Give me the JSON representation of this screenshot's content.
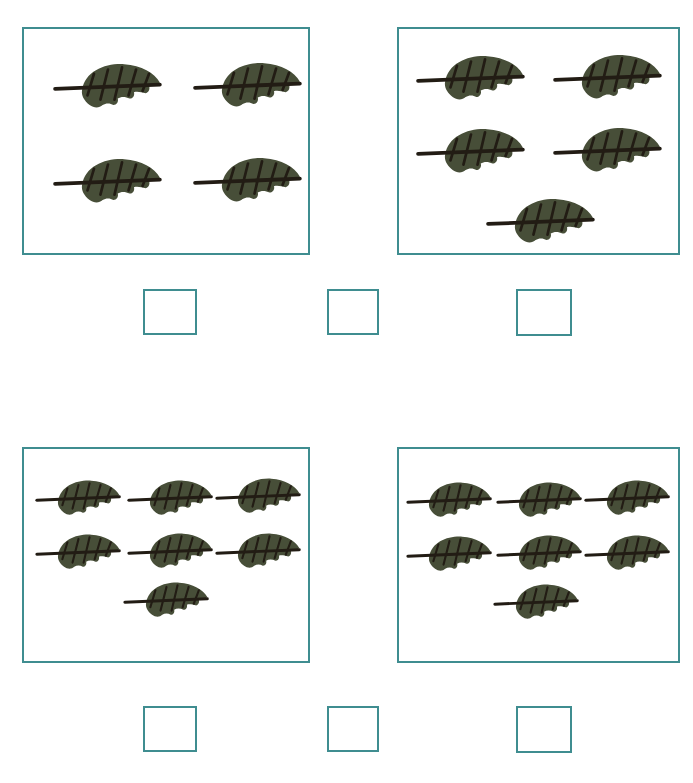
{
  "page": {
    "background_color": "#ffffff",
    "width": 693,
    "height": 783
  },
  "theme": {
    "box_border_color": "#3f8d90",
    "leaf_body_color": "#474e38",
    "leaf_stem_color": "#221c14",
    "leaf_vein_color": "#221c14",
    "accent_orange": "#e8823c"
  },
  "object_icon": {
    "name": "leaf-icon",
    "label": "leaf"
  },
  "groups": [
    {
      "id": "group-1",
      "label": "Group 1",
      "count": 4,
      "rows": [
        2,
        2
      ],
      "rect": {
        "x": 22,
        "y": 27,
        "w": 288,
        "h": 228
      },
      "leaves": [
        {
          "x": 30,
          "y": 33,
          "w": 108,
          "h": 56
        },
        {
          "x": 170,
          "y": 32,
          "w": 108,
          "h": 56
        },
        {
          "x": 30,
          "y": 128,
          "w": 108,
          "h": 56
        },
        {
          "x": 170,
          "y": 127,
          "w": 108,
          "h": 56
        }
      ]
    },
    {
      "id": "group-2",
      "label": "Group 2",
      "count": 5,
      "rows": [
        2,
        2,
        1
      ],
      "rect": {
        "x": 397,
        "y": 27,
        "w": 283,
        "h": 228
      },
      "leaves": [
        {
          "x": 18,
          "y": 25,
          "w": 108,
          "h": 56
        },
        {
          "x": 155,
          "y": 24,
          "w": 108,
          "h": 56
        },
        {
          "x": 18,
          "y": 98,
          "w": 108,
          "h": 56
        },
        {
          "x": 155,
          "y": 97,
          "w": 108,
          "h": 56
        },
        {
          "x": 88,
          "y": 168,
          "w": 108,
          "h": 56
        }
      ]
    },
    {
      "id": "group-3",
      "label": "Group 3",
      "count": 7,
      "rows": [
        3,
        3,
        1
      ],
      "rect": {
        "x": 22,
        "y": 447,
        "w": 288,
        "h": 216
      },
      "leaves": [
        {
          "x": 12,
          "y": 30,
          "w": 85,
          "h": 44
        },
        {
          "x": 104,
          "y": 30,
          "w": 85,
          "h": 44
        },
        {
          "x": 192,
          "y": 28,
          "w": 85,
          "h": 44
        },
        {
          "x": 12,
          "y": 84,
          "w": 85,
          "h": 44
        },
        {
          "x": 104,
          "y": 83,
          "w": 85,
          "h": 44
        },
        {
          "x": 192,
          "y": 83,
          "w": 85,
          "h": 44
        },
        {
          "x": 100,
          "y": 132,
          "w": 85,
          "h": 44
        }
      ]
    },
    {
      "id": "group-4",
      "label": "Group 4",
      "count": 7,
      "rows": [
        3,
        3,
        1
      ],
      "rect": {
        "x": 397,
        "y": 447,
        "w": 283,
        "h": 216
      },
      "leaves": [
        {
          "x": 8,
          "y": 32,
          "w": 85,
          "h": 44
        },
        {
          "x": 98,
          "y": 32,
          "w": 85,
          "h": 44
        },
        {
          "x": 186,
          "y": 30,
          "w": 85,
          "h": 44
        },
        {
          "x": 8,
          "y": 86,
          "w": 85,
          "h": 44
        },
        {
          "x": 98,
          "y": 85,
          "w": 85,
          "h": 44
        },
        {
          "x": 186,
          "y": 85,
          "w": 85,
          "h": 44
        },
        {
          "x": 95,
          "y": 134,
          "w": 85,
          "h": 44
        }
      ]
    }
  ],
  "answer_rows": [
    {
      "id": "answer-row-1",
      "label": "Answer row 1",
      "boxes": [
        {
          "id": "answer-box-1",
          "value": "",
          "placeholder": "",
          "rect": {
            "x": 143,
            "y": 289,
            "w": 54,
            "h": 46
          }
        },
        {
          "id": "answer-box-2",
          "value": "",
          "placeholder": "",
          "rect": {
            "x": 327,
            "y": 289,
            "w": 52,
            "h": 46
          }
        },
        {
          "id": "answer-box-3",
          "value": "",
          "placeholder": "",
          "rect": {
            "x": 516,
            "y": 289,
            "w": 56,
            "h": 47
          }
        }
      ]
    },
    {
      "id": "answer-row-2",
      "label": "Answer row 2",
      "boxes": [
        {
          "id": "answer-box-4",
          "value": "",
          "placeholder": "",
          "rect": {
            "x": 143,
            "y": 706,
            "w": 54,
            "h": 46
          }
        },
        {
          "id": "answer-box-5",
          "value": "",
          "placeholder": "",
          "rect": {
            "x": 327,
            "y": 706,
            "w": 52,
            "h": 46
          }
        },
        {
          "id": "answer-box-6",
          "value": "",
          "placeholder": "",
          "rect": {
            "x": 516,
            "y": 706,
            "w": 56,
            "h": 47
          }
        }
      ]
    }
  ],
  "bottom_mark": {
    "name": "orange-arc-fragment",
    "color": "#e8823c",
    "rect": {
      "x": 333,
      "y": 776,
      "w": 32,
      "h": 7
    }
  }
}
